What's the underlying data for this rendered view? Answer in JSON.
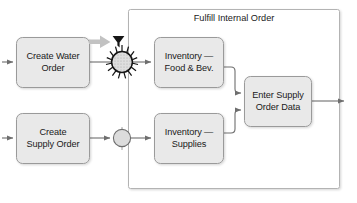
{
  "diagram": {
    "type": "process-flow",
    "group": {
      "title": "Fulfill Internal Order",
      "x": 128,
      "y": 9,
      "width": 212,
      "height": 180,
      "border_color": "#aaaaaa",
      "fill": "#ffffff"
    },
    "style": {
      "node_fill": "#e9e9e9",
      "node_stroke": "#9a9a9a",
      "connector_color": "#6e6e6e",
      "accent_gray_arrow": "#b8b8b8",
      "text_color": "#1a1a1a"
    },
    "nodes": [
      {
        "id": "create-water-order",
        "label_line1": "Create Water",
        "label_line2": "Order",
        "x": 16,
        "y": 37,
        "width": 74,
        "height": 51,
        "shape": "rounded-rect"
      },
      {
        "id": "create-supply-order",
        "label_line1": "Create",
        "label_line2": "Supply Order",
        "x": 16,
        "y": 113,
        "width": 74,
        "height": 51,
        "shape": "rounded-rect"
      },
      {
        "id": "inventory-food-bev",
        "label_line1": "Inventory —",
        "label_line2": "Food & Bev.",
        "x": 154,
        "y": 37,
        "width": 70,
        "height": 51,
        "shape": "rounded-rect"
      },
      {
        "id": "inventory-supplies",
        "label_line1": "Inventory —",
        "label_line2": "Supplies",
        "x": 154,
        "y": 113,
        "width": 70,
        "height": 51,
        "shape": "rounded-rect"
      },
      {
        "id": "enter-supply-order-data",
        "label_line1": "Enter Supply",
        "label_line2": "Order Data",
        "x": 244,
        "y": 76,
        "width": 68,
        "height": 51,
        "shape": "rounded-rect"
      }
    ],
    "junctions": [
      {
        "id": "burst-junction",
        "kind": "sunburst",
        "cx": 122,
        "cy": 62,
        "radius": 11,
        "spikes": 16,
        "fill": "#d8d8d8"
      },
      {
        "id": "plain-junction",
        "kind": "circle",
        "cx": 122,
        "cy": 138,
        "radius": 9,
        "fill": "#d8d8d8"
      }
    ],
    "markers": [
      {
        "id": "highlight-pointer",
        "kind": "fat-arrow",
        "description": "thick light-gray arrow pointing right toward the burst junction",
        "color": "#b8b8b8"
      },
      {
        "id": "cursor-pointer",
        "kind": "cursor-funnel",
        "description": "dark funnel/cursor glyph above the burst junction",
        "color": "#1a1a1a"
      }
    ],
    "edges": [
      {
        "id": "in-water",
        "from": "external-left",
        "to": "create-water-order",
        "arrow": true
      },
      {
        "id": "in-supply",
        "from": "external-left",
        "to": "create-supply-order",
        "arrow": true
      },
      {
        "id": "water-to-burst",
        "from": "create-water-order",
        "to": "burst-junction",
        "arrow": false
      },
      {
        "id": "burst-to-food",
        "from": "burst-junction",
        "to": "inventory-food-bev",
        "arrow": true
      },
      {
        "id": "supply-to-circle",
        "from": "create-supply-order",
        "to": "plain-junction",
        "arrow": true
      },
      {
        "id": "circle-to-supplies",
        "from": "plain-junction",
        "to": "inventory-supplies",
        "arrow": true
      },
      {
        "id": "food-to-enter",
        "from": "inventory-food-bev",
        "to": "enter-supply-order-data",
        "arrow": true
      },
      {
        "id": "supplies-to-enter",
        "from": "inventory-supplies",
        "to": "enter-supply-order-data",
        "arrow": true
      },
      {
        "id": "enter-to-out",
        "from": "enter-supply-order-data",
        "to": "external-right",
        "arrow": true
      }
    ]
  }
}
